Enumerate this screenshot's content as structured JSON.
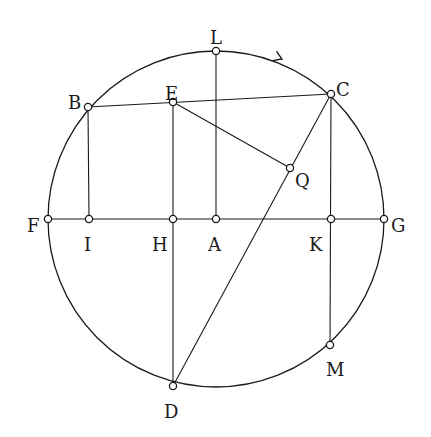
{
  "diagram": {
    "circle": {
      "center": "A",
      "cx": 216,
      "cy": 219,
      "r": 168
    },
    "points": [
      {
        "id": "L",
        "label": "L",
        "x": 216,
        "y": 51,
        "lx": 210,
        "ly": 38
      },
      {
        "id": "B",
        "label": "B",
        "x": 88,
        "y": 107,
        "lx": 68,
        "ly": 103
      },
      {
        "id": "E",
        "label": "E",
        "x": 173,
        "y": 102,
        "lx": 165,
        "ly": 94
      },
      {
        "id": "C",
        "label": "C",
        "x": 331,
        "y": 94,
        "lx": 336,
        "ly": 90
      },
      {
        "id": "Q",
        "label": "Q",
        "x": 290,
        "y": 168,
        "lx": 295,
        "ly": 181
      },
      {
        "id": "F",
        "label": "F",
        "x": 48,
        "y": 219,
        "lx": 27,
        "ly": 226
      },
      {
        "id": "I",
        "label": "I",
        "x": 89,
        "y": 219,
        "lx": 84,
        "ly": 245
      },
      {
        "id": "H",
        "label": "H",
        "x": 173,
        "y": 219,
        "lx": 152,
        "ly": 245
      },
      {
        "id": "A",
        "label": "A",
        "x": 216,
        "y": 219,
        "lx": 208,
        "ly": 245
      },
      {
        "id": "K",
        "label": "K",
        "x": 331,
        "y": 219,
        "lx": 309,
        "ly": 245
      },
      {
        "id": "G",
        "label": "G",
        "x": 384,
        "y": 219,
        "lx": 391,
        "ly": 226
      },
      {
        "id": "M",
        "label": "M",
        "x": 330,
        "y": 345,
        "lx": 326,
        "ly": 370
      },
      {
        "id": "D",
        "label": "D",
        "x": 173,
        "y": 386,
        "lx": 164,
        "ly": 412
      }
    ],
    "segments": [
      {
        "from": "F",
        "to": "G"
      },
      {
        "from": "L",
        "to": "A"
      },
      {
        "from": "B",
        "to": "C"
      },
      {
        "from": "B",
        "to": "I"
      },
      {
        "from": "E",
        "to": "D"
      },
      {
        "from": "E",
        "to": "Q"
      },
      {
        "from": "C",
        "to": "D"
      },
      {
        "from": "C",
        "to": "M"
      }
    ],
    "arrow": {
      "x": 282,
      "y": 59,
      "direction": "clockwise"
    }
  }
}
